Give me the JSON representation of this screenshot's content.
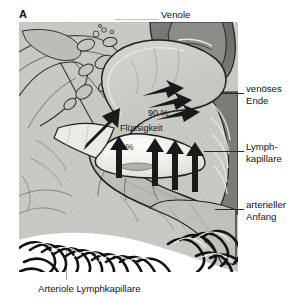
{
  "figure": {
    "panel_letter": "A",
    "caption": "Arteriole Lymphkapillare",
    "background_color": "#c9c9c4",
    "ink_color": "#1b1b1b"
  },
  "labels": {
    "top": "Venole",
    "venous_end": "venöses\nEnde",
    "venous_end_line1": "venöses",
    "venous_end_line2": "Ende",
    "lymph_capillary_line1": "Lymph-",
    "lymph_capillary_line2": "kapillare",
    "arterial_start_line1": "arterieller",
    "arterial_start_line2": "Anfang"
  },
  "annotations": {
    "fraction_venous": "90 %",
    "fluid": "Flüssigkeit",
    "fraction_lymph": "10 %"
  },
  "icons": {
    "leader_line": "leader-line",
    "flow_arrow": "arrow-icon"
  }
}
